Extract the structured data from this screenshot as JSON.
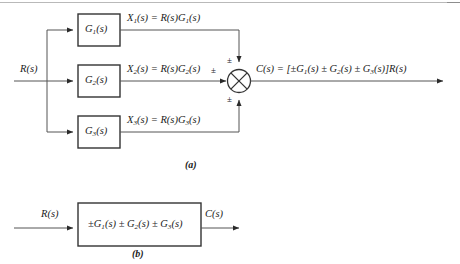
{
  "figure": {
    "domain": "Diagram",
    "background_color": "#ffffff",
    "line_color": "#4a4a4a",
    "text_color": "#1b1b1b"
  },
  "part_a": {
    "caption": "(a)",
    "input_label": "R(s)",
    "blocks": [
      {
        "name": "block-g1",
        "label_base": "G",
        "label_sub": "1",
        "label_tail": "(s)"
      },
      {
        "name": "block-g2",
        "label_base": "G",
        "label_sub": "2",
        "label_tail": "(s)"
      },
      {
        "name": "block-g3",
        "label_base": "G",
        "label_sub": "3",
        "label_tail": "(s)"
      }
    ],
    "signal_labels": [
      {
        "name": "signal-x1",
        "x_base": "X",
        "x_sub": "1",
        "text": "(s) = R(s)G",
        "g_sub": "1",
        "tail": "(s)"
      },
      {
        "name": "signal-x2",
        "x_base": "X",
        "x_sub": "2",
        "text": "(s) = R(s)G",
        "g_sub": "2",
        "tail": "(s)"
      },
      {
        "name": "signal-x3",
        "x_base": "X",
        "x_sub": "3",
        "text": "(s) = R(s)G",
        "g_sub": "3",
        "tail": "(s)"
      }
    ],
    "summing_junction": {
      "name": "summing-junction",
      "symbol": "circle-with-cross",
      "signs": {
        "top": "±",
        "left": "±",
        "bottom": "±"
      }
    },
    "output_equation": {
      "name": "output-equation",
      "lead": "C(s) = [±G",
      "sub1": "1",
      "mid1": "(s) ± G",
      "sub2": "2",
      "mid2": "(s) ± G",
      "sub3": "3",
      "tail": "(s)]R(s)"
    }
  },
  "part_b": {
    "caption": "(b)",
    "input_label": "R(s)",
    "output_label": "C(s)",
    "block": {
      "name": "block-equivalent",
      "lead": "±G",
      "sub1": "1",
      "mid1": "(s) ± G",
      "sub2": "2",
      "mid2": "(s) ± G",
      "sub3": "3",
      "tail": "(s)"
    }
  }
}
